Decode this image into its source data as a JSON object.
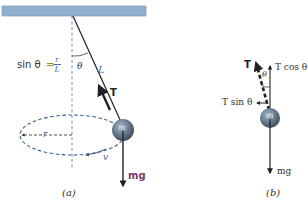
{
  "colors": {
    "ceiling": "#8fb0cc",
    "ceiling_edge": "#6f92b1",
    "ball": "#6a7e90",
    "ball_highlight": "#9fb2c2",
    "ball_shadow": "#3e4f60",
    "line": "#222222",
    "dashed_axis": "#6f8fb0",
    "ellipse": "#3a5f8f",
    "mg_text": "#7a3a6a",
    "formula_text": "#333333",
    "formula_equals": "#9a8a2a",
    "formula_fraction": "#4a6fa5",
    "label_text": "#333333"
  },
  "panel_a": {
    "caption": "(a)",
    "formula": {
      "lhs": "sin θ",
      "equals": "=",
      "numerator": "r",
      "denominator": "L"
    },
    "angle_label": "θ",
    "length_label": "L",
    "tension_label": "T",
    "mass_label": "m",
    "radius_label": "r",
    "velocity_label": "v",
    "weight_label": "mg"
  },
  "panel_b": {
    "caption": "(b)",
    "tension_label": "T",
    "angle_label": "θ",
    "vertical_component_label": "T cos θ",
    "horizontal_component_label": "T sin θ",
    "mass_label": "m",
    "weight_label": "mg"
  }
}
